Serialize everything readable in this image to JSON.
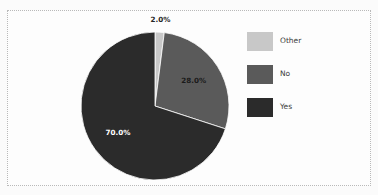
{
  "figure": {
    "background_color": "#fbfbfb",
    "axes_background_color": "#fdfdfd",
    "frame_color": "#b9b9b9",
    "frame_style": "dotted"
  },
  "chart_data": {
    "type": "pie",
    "title": "",
    "labels": [
      "Other",
      "No",
      "Yes"
    ],
    "values": [
      2.0,
      28.0,
      70.0
    ],
    "value_labels": [
      "2.0%",
      "28.0%",
      "70.0%"
    ],
    "colors": [
      "#c8c8c8",
      "#5a5a5a",
      "#2b2b2b"
    ],
    "label_text_colors": [
      "#262626",
      "#1a1a1a",
      "#ffffff"
    ],
    "start_angle_deg": 90,
    "direction": "clockwise",
    "autopct": "%1.1f%%",
    "legend": {
      "position": "right",
      "entries": [
        {
          "label": "Other",
          "color": "#c8c8c8"
        },
        {
          "label": "No",
          "color": "#5a5a5a"
        },
        {
          "label": "Yes",
          "color": "#2b2b2b"
        }
      ]
    },
    "geometry": {
      "center_x": 155,
      "center_y": 106,
      "radius": 74,
      "label_radius_factor": 0.62
    }
  }
}
